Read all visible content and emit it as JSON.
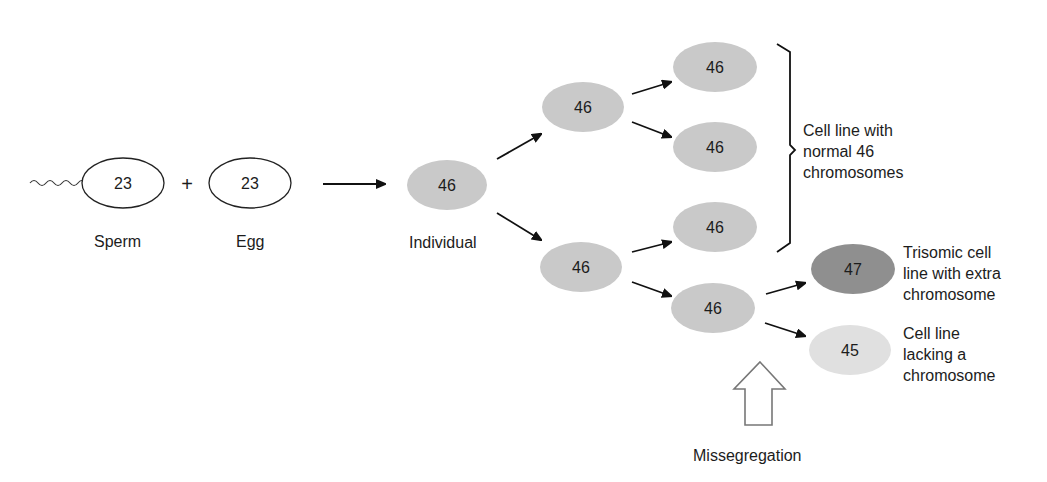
{
  "diagram": {
    "colors": {
      "normal_cell": "#c9c9c9",
      "trisomic_cell": "#8f8f8f",
      "monosomic_cell": "#e0e0e0",
      "outline": "#222222",
      "background": "#ffffff"
    },
    "gametes": {
      "sperm": {
        "count": "23",
        "label": "Sperm"
      },
      "plus": "+",
      "egg": {
        "count": "23",
        "label": "Egg"
      }
    },
    "individual": {
      "count": "46",
      "label": "Individual"
    },
    "daughters": [
      {
        "count": "46"
      },
      {
        "count": "46"
      }
    ],
    "granddaughters": [
      {
        "count": "46"
      },
      {
        "count": "46"
      },
      {
        "count": "46"
      },
      {
        "count": "46"
      }
    ],
    "abnormal": [
      {
        "count": "47",
        "label_lines": [
          "Trisomic cell",
          "line with extra",
          "chromosome"
        ]
      },
      {
        "count": "45",
        "label_lines": [
          "Cell line",
          "lacking a",
          "chromosome"
        ]
      }
    ],
    "normal_bracket_label_lines": [
      "Cell line with",
      "normal 46",
      "chromosomes"
    ],
    "event_label": "Missegregation"
  }
}
